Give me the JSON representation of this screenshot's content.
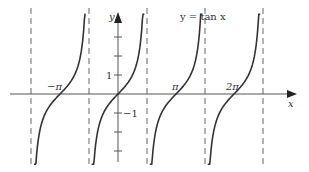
{
  "chart_data": {
    "type": "line",
    "title": "y = tan x",
    "xlabel": "x",
    "ylabel": "y",
    "function": "tan",
    "x_tick_labels": [
      "−π",
      "π",
      "2π"
    ],
    "x_tick_values": [
      -3.14159,
      3.14159,
      6.28319
    ],
    "y_tick_labels": [
      "1",
      "−1"
    ],
    "y_tick_values": [
      1,
      -1
    ],
    "y_unlabeled_ticks": [
      2,
      3,
      -2,
      -3
    ],
    "asymptotes": [
      -1.5708,
      1.5708,
      4.7124,
      7.854,
      -4.7124
    ],
    "asymptote_style": "dashed",
    "xlim": [
      -6.3,
      9.5
    ],
    "ylim": [
      -3.7,
      4.2
    ],
    "grid": false,
    "legend": "none",
    "branches": [
      {
        "x_center": -3.14159,
        "x_range": [
          -4.55,
          -1.75
        ]
      },
      {
        "x_center": 0,
        "x_range": [
          -1.43,
          1.43
        ]
      },
      {
        "x_center": 3.14159,
        "x_range": [
          1.72,
          4.55
        ]
      },
      {
        "x_center": 6.28319,
        "x_range": [
          4.86,
          7.7
        ]
      }
    ]
  },
  "colors": {
    "curve": "#333333",
    "axis": "#555555",
    "asymptote": "#666666",
    "background": "#ffffff"
  }
}
